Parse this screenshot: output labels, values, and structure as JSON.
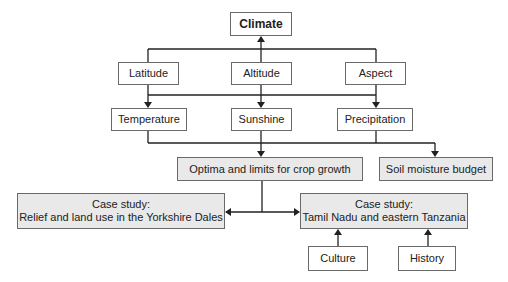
{
  "diagram": {
    "root": {
      "label": "Climate"
    },
    "factors": [
      {
        "label": "Latitude"
      },
      {
        "label": "Altitude"
      },
      {
        "label": "Aspect"
      }
    ],
    "elements": [
      {
        "label": "Temperature"
      },
      {
        "label": "Sunshine"
      },
      {
        "label": "Precipitation"
      }
    ],
    "outcomes": [
      {
        "label": "Optima and limits for crop growth"
      },
      {
        "label": "Soil moisture budget"
      }
    ],
    "case_studies": [
      {
        "line1": "Case study:",
        "line2": "Relief and land use in the Yorkshire Dales"
      },
      {
        "line1": "Case study:",
        "line2": "Tamil Nadu and eastern Tanzania"
      }
    ],
    "influences": [
      {
        "label": "Culture"
      },
      {
        "label": "History"
      }
    ],
    "colors": {
      "shaded_fill": "#e9e9e9",
      "border": "#6a6a6a",
      "line": "#222222"
    }
  }
}
